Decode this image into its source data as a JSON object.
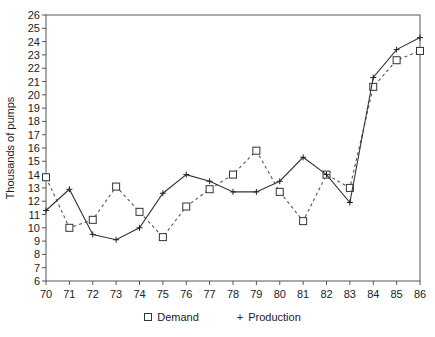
{
  "chart_data": {
    "type": "line",
    "title": "",
    "xlabel": "",
    "ylabel": "Thousands of pumps",
    "x": [
      70,
      71,
      72,
      73,
      74,
      75,
      76,
      77,
      78,
      79,
      80,
      81,
      82,
      83,
      84,
      85,
      86
    ],
    "xlim": [
      70,
      86
    ],
    "ylim": [
      6,
      26
    ],
    "yticks": [
      6,
      7,
      8,
      9,
      10,
      11,
      12,
      13,
      14,
      15,
      16,
      17,
      18,
      19,
      20,
      21,
      22,
      23,
      24,
      25,
      26
    ],
    "grid": false,
    "legend_position": "bottom",
    "series": [
      {
        "name": "Demand",
        "marker": "square",
        "line_style": "dashed",
        "color": "#555555",
        "values": [
          13.8,
          10.0,
          10.6,
          13.1,
          11.2,
          9.3,
          11.6,
          12.9,
          14.0,
          15.8,
          12.7,
          10.5,
          14.0,
          13.0,
          20.6,
          22.6,
          23.3
        ]
      },
      {
        "name": "Production",
        "marker": "plus",
        "line_style": "solid",
        "color": "#333333",
        "values": [
          11.3,
          12.9,
          9.5,
          9.1,
          10.0,
          12.6,
          14.0,
          13.5,
          12.7,
          12.7,
          13.5,
          15.3,
          14.0,
          11.9,
          21.3,
          23.4,
          24.3
        ]
      }
    ]
  },
  "legend": {
    "demand_label": "Demand",
    "production_label": "Production"
  },
  "axis": {
    "ylabel": "Thousands of pumps"
  }
}
